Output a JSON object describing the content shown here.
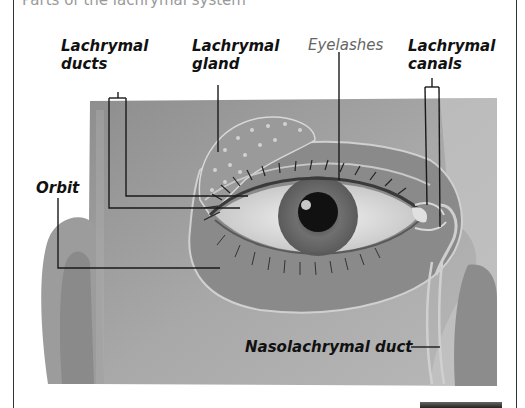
{
  "figure": {
    "top_caption": "Parts of the lachrymal system",
    "labels": {
      "lachrymal_ducts": [
        "Lachrymal",
        "ducts"
      ],
      "lachrymal_gland": [
        "Lachrymal",
        "gland"
      ],
      "eyelashes": "Eyelashes",
      "lachrymal_canals": [
        "Lachrymal",
        "canals"
      ],
      "orbit": "Orbit",
      "nasolachrymal_duct": "Nasolachrymal duct"
    },
    "colors": {
      "background": "#ffffff",
      "illustration_gray": "#9a9a9a",
      "label_text": "#111111",
      "light_label_text": "#666666",
      "leader_line": "#1a1a1a"
    }
  }
}
